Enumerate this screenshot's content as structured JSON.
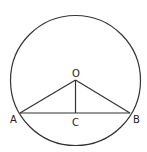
{
  "diagram": {
    "type": "geometry",
    "colors": {
      "stroke": "#333333",
      "background": "#ffffff"
    },
    "circle": {
      "center": "O",
      "cx": 75.5,
      "cy": 80.5,
      "r": 65
    },
    "points": {
      "O": {
        "label": "O",
        "x": 75.5,
        "y": 80
      },
      "A": {
        "label": "A",
        "x": 20,
        "y": 113
      },
      "B": {
        "label": "B",
        "x": 130,
        "y": 113
      },
      "C": {
        "label": "C",
        "x": 75.5,
        "y": 113
      }
    },
    "segments": [
      {
        "from": "O",
        "to": "A"
      },
      {
        "from": "O",
        "to": "B"
      },
      {
        "from": "O",
        "to": "C"
      },
      {
        "from": "A",
        "to": "B"
      }
    ]
  }
}
